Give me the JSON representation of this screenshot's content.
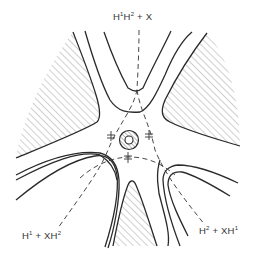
{
  "figure": {
    "type": "potential-energy-surface-contour-diagram",
    "labels": {
      "top": {
        "parts": [
          "H",
          "1",
          "H",
          "2",
          " + X"
        ],
        "text": "H¹H² + X"
      },
      "bottom_left": {
        "parts": [
          "H",
          "1",
          " + XH",
          "2"
        ],
        "text": "H¹ + XH²"
      },
      "bottom_right": {
        "parts": [
          "H",
          "2",
          " + XH",
          "1"
        ],
        "text": "H² + XH¹"
      }
    },
    "features": {
      "hatched_regions": [
        "upper-left",
        "upper-right",
        "bottom-center"
      ],
      "central_well": "concentric-circles-with-hatched-ring",
      "saddle_point_markers": 3,
      "reaction_paths": 3,
      "valleys": 3
    },
    "colors": {
      "line": "#2a2a2a",
      "hatch": "#8a8a8a",
      "background": "#ffffff"
    }
  }
}
